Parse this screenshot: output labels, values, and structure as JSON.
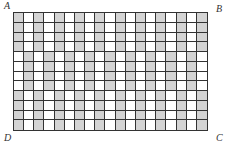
{
  "figure": {
    "type": "shaded-rectangle-grid",
    "columns": 19,
    "rows": 12,
    "bands": [
      {
        "rows": [
          0,
          1,
          2,
          3
        ],
        "shaded_columns": "even"
      },
      {
        "rows": [
          4,
          5,
          6,
          7
        ],
        "shaded_columns": "odd"
      },
      {
        "rows": [
          8,
          9,
          10,
          11
        ],
        "shaded_columns": "even"
      }
    ],
    "colors": {
      "shaded": "#d4d4d4",
      "unshaded": "#ffffff",
      "lines": "#333333"
    }
  },
  "labels": {
    "top_left": "A",
    "top_right": "B",
    "bottom_right": "C",
    "bottom_left": "D"
  }
}
